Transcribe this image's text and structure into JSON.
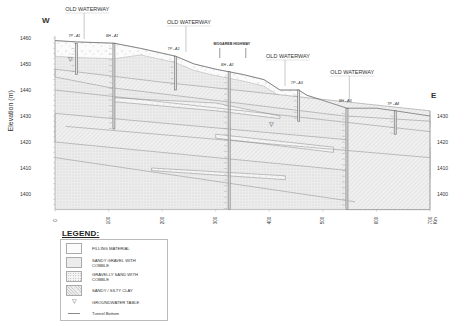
{
  "diagram": {
    "type": "geological cross-section",
    "direction_left": "W",
    "direction_right": "E",
    "y_axis": {
      "label": "Elevation (m)",
      "left_ticks": [
        "1460",
        "1450",
        "1440",
        "1430",
        "1420",
        "1410",
        "1400"
      ],
      "right_ticks": [
        "1430",
        "1420",
        "1410",
        "1400"
      ],
      "range": [
        1394,
        1462
      ]
    },
    "x_axis": {
      "ticks": [
        "0",
        "100",
        "200",
        "300",
        "400",
        "500",
        "600",
        "700"
      ],
      "unit": "Km",
      "range": [
        0,
        700
      ]
    },
    "annotations": [
      {
        "id": "ow1",
        "text": "OLD WATERWAY",
        "x": 60
      },
      {
        "id": "ow2",
        "text": "OLD WATERWAY",
        "x": 250
      },
      {
        "id": "hwy",
        "text": "MOGAREB HIGHWAY",
        "x": 330
      },
      {
        "id": "ow3",
        "text": "OLD WATERWAY",
        "x": 435
      },
      {
        "id": "ow4",
        "text": "OLD WATERWAY",
        "x": 555
      }
    ],
    "boreholes": [
      {
        "name": "TP - A1",
        "x": 40,
        "top": 1458,
        "bottom": 1446
      },
      {
        "name": "BH - A1",
        "x": 110,
        "top": 1458,
        "bottom": 1425
      },
      {
        "name": "TP - A2",
        "x": 225,
        "top": 1453,
        "bottom": 1440
      },
      {
        "name": "BH - A2",
        "x": 325,
        "top": 1447,
        "bottom": 1394
      },
      {
        "name": "TP - A3",
        "x": 455,
        "top": 1440,
        "bottom": 1428
      },
      {
        "name": "BH - A3",
        "x": 545,
        "top": 1433,
        "bottom": 1394
      },
      {
        "name": "TP - A4",
        "x": 635,
        "top": 1432,
        "bottom": 1423
      }
    ]
  },
  "legend": {
    "title": "LEGEND:",
    "items": [
      {
        "key": "fill",
        "label": "FILLING MATERIAL"
      },
      {
        "key": "sg",
        "label": "SANDY GRAVEL WITH COBBLE"
      },
      {
        "key": "gs",
        "label": "GRAVELLY SAND WITH COBBLE"
      },
      {
        "key": "clay",
        "label": "SANDY / SILTY CLAY"
      },
      {
        "key": "gw",
        "label": "GROUNDWATER TABLE",
        "symbol": "▽"
      },
      {
        "key": "tb",
        "label": "Tunnel Bottom"
      }
    ]
  }
}
